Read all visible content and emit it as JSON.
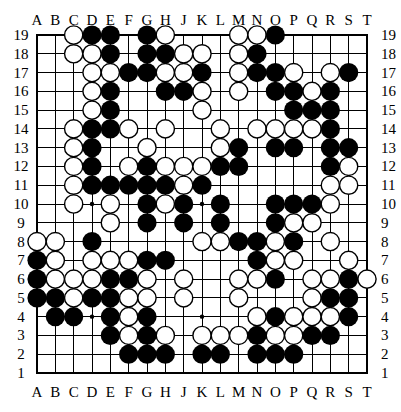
{
  "board": {
    "size": 19,
    "columns": [
      "A",
      "B",
      "C",
      "D",
      "E",
      "F",
      "G",
      "H",
      "J",
      "K",
      "L",
      "M",
      "N",
      "O",
      "P",
      "Q",
      "R",
      "S",
      "T"
    ],
    "rows": [
      "19",
      "18",
      "17",
      "16",
      "15",
      "14",
      "13",
      "12",
      "11",
      "10",
      "9",
      "8",
      "7",
      "6",
      "5",
      "4",
      "3",
      "2",
      "1"
    ],
    "colors": {
      "black": "#000000",
      "white": "#ffffff",
      "line": "#000000",
      "background": "#ffffff"
    },
    "star_points": [
      "D10",
      "K10",
      "D4",
      "K4"
    ],
    "stones": {
      "black": [
        "D19",
        "E19",
        "G19",
        "O19",
        "E18",
        "G18",
        "H18",
        "N18",
        "F17",
        "G17",
        "K17",
        "N17",
        "O17",
        "S17",
        "E16",
        "H16",
        "J16",
        "O16",
        "P16",
        "R16",
        "E15",
        "P15",
        "Q15",
        "R15",
        "D14",
        "E14",
        "R14",
        "D13",
        "M13",
        "O13",
        "P13",
        "R13",
        "S13",
        "D12",
        "G12",
        "L12",
        "M12",
        "R12",
        "D11",
        "E11",
        "F11",
        "G11",
        "H11",
        "K11",
        "G10",
        "J10",
        "L10",
        "O10",
        "P10",
        "Q10",
        "G9",
        "J9",
        "L9",
        "O9",
        "D8",
        "M8",
        "N8",
        "P8",
        "A7",
        "G7",
        "H7",
        "N7",
        "A6",
        "E6",
        "F6",
        "O6",
        "S6",
        "A5",
        "B5",
        "D5",
        "E5",
        "R5",
        "S5",
        "B4",
        "C4",
        "E4",
        "G4",
        "O4",
        "S4",
        "E3",
        "G3",
        "N3",
        "Q3",
        "R3",
        "F2",
        "G2",
        "H2",
        "K2",
        "L2",
        "N2",
        "O2",
        "P2"
      ],
      "white": [
        "C19",
        "H19",
        "M19",
        "N19",
        "C18",
        "D18",
        "J18",
        "K18",
        "M18",
        "D17",
        "E17",
        "H17",
        "J17",
        "M17",
        "P17",
        "R17",
        "D16",
        "K16",
        "M16",
        "Q16",
        "D15",
        "K15",
        "C14",
        "F14",
        "H14",
        "L14",
        "N14",
        "O14",
        "P14",
        "Q14",
        "C13",
        "G13",
        "L13",
        "C12",
        "F12",
        "H12",
        "J12",
        "K12",
        "S12",
        "C11",
        "J11",
        "R11",
        "S11",
        "C10",
        "E10",
        "H10",
        "R10",
        "E9",
        "P9",
        "Q9",
        "A8",
        "B8",
        "K8",
        "L8",
        "O8",
        "R8",
        "B7",
        "D7",
        "E7",
        "F7",
        "O7",
        "P7",
        "S7",
        "B6",
        "C6",
        "D6",
        "G6",
        "J6",
        "M6",
        "N6",
        "Q6",
        "R6",
        "T6",
        "C5",
        "F5",
        "G5",
        "J5",
        "M5",
        "Q5",
        "F4",
        "N4",
        "P4",
        "Q4",
        "R4",
        "F3",
        "H3",
        "K3",
        "L3",
        "M3",
        "O3",
        "P3"
      ]
    }
  }
}
